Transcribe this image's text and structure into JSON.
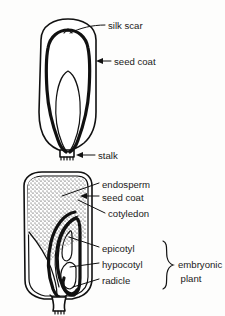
{
  "figure": {
    "background_color": "#fdfdfc",
    "ink_color": "#111111"
  },
  "upper_diagram": {
    "name": "whole-seed-exterior",
    "labels": [
      {
        "id": "silk-scar",
        "text": "silk scar",
        "x": 108,
        "y": 27
      },
      {
        "id": "seed-coat",
        "text": "seed coat",
        "x": 114,
        "y": 64
      },
      {
        "id": "stalk",
        "text": "stalk",
        "x": 98,
        "y": 158
      }
    ]
  },
  "lower_diagram": {
    "name": "seed-cross-section",
    "labels": [
      {
        "id": "endosperm",
        "text": "endosperm",
        "x": 102,
        "y": 187
      },
      {
        "id": "seed-coat",
        "text": "seed coat",
        "x": 102,
        "y": 200
      },
      {
        "id": "cotyledon",
        "text": "cotyledon",
        "x": 108,
        "y": 216
      },
      {
        "id": "epicotyl",
        "text": "epicotyl",
        "x": 102,
        "y": 251
      },
      {
        "id": "hypocotyl",
        "text": "hypocotyl",
        "x": 102,
        "y": 267
      },
      {
        "id": "radicle",
        "text": "radicle",
        "x": 102,
        "y": 283
      }
    ],
    "group_label": {
      "id": "embryonic-plant",
      "line1": "embryonic",
      "line2": "plant",
      "x": 192,
      "y1": 265,
      "y2": 279
    }
  }
}
